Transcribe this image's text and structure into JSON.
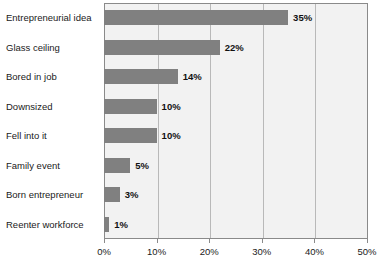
{
  "chart_data": {
    "type": "bar",
    "orientation": "horizontal",
    "title": "",
    "subtitle": "",
    "xlabel": "",
    "ylabel": "",
    "xlim": [
      0,
      50
    ],
    "grid": true,
    "legend": "none",
    "categories": [
      "Entrepreneurial idea",
      "Glass ceiling",
      "Bored in job",
      "Downsized",
      "Fell into it",
      "Family event",
      "Born entrepreneur",
      "Reenter workforce"
    ],
    "values": [
      35,
      22,
      14,
      10,
      10,
      5,
      3,
      1
    ],
    "data_labels": [
      "35%",
      "22%",
      "14%",
      "10%",
      "10%",
      "5%",
      "3%",
      "1%"
    ],
    "xticks": [
      0,
      10,
      20,
      30,
      40,
      50
    ],
    "xtick_labels": [
      "0%",
      "10%",
      "20%",
      "30%",
      "40%",
      "50%"
    ],
    "colors": {
      "bar": "#808080",
      "plot_background": "#f2f2f2",
      "page_background": "#ffffff",
      "gridline": "#b9b9b9",
      "frame": "#8a8a8a",
      "text": "#1a1a1a"
    }
  }
}
